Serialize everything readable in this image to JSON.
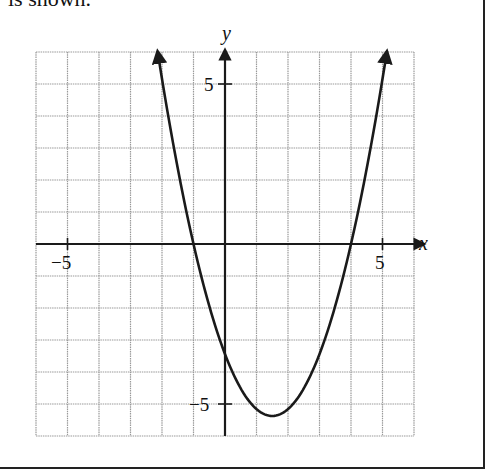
{
  "caption": "is shown.",
  "chart_data": {
    "type": "line",
    "title": "",
    "xlabel": "x",
    "ylabel": "y",
    "xlim": [
      -6,
      6
    ],
    "ylim": [
      -6,
      6
    ],
    "grid": true,
    "grid_step": 1,
    "tick_labels": {
      "x": [
        {
          "value": -5,
          "label": "−5"
        },
        {
          "value": 5,
          "label": "5"
        }
      ],
      "y": [
        {
          "value": 5,
          "label": "5"
        },
        {
          "value": -5,
          "label": "−5"
        }
      ]
    },
    "series": [
      {
        "name": "parabola",
        "function": "y ≈ 0.86(x + 1)(x − 4)",
        "x_intercepts": [
          -1,
          4
        ],
        "y_intercept": -3.4,
        "vertex": [
          1.5,
          -5.4
        ],
        "ends_with_arrows": true,
        "x": [
          -2.14,
          -2,
          -1.5,
          -1,
          -0.5,
          0,
          0.5,
          1,
          1.5,
          2,
          2.5,
          3,
          3.5,
          4,
          4.5,
          5,
          5.14
        ],
        "y": [
          6.0,
          5.16,
          3.66,
          0,
          -2.19,
          -3.44,
          -4.52,
          -5.16,
          -5.38,
          -5.16,
          -4.52,
          -3.44,
          -2.19,
          0,
          2.15,
          5.16,
          6.0
        ]
      }
    ]
  },
  "axes": {
    "x_label": "x",
    "y_label": "y"
  },
  "ticks": {
    "x_neg5": "−5",
    "x_pos5": "5",
    "y_pos5": "5",
    "y_neg5": "−5"
  },
  "colors": {
    "grid": "#9a9a9a",
    "axis": "#1a1a1a",
    "curve": "#1a1a1a",
    "frame": "#222222"
  }
}
